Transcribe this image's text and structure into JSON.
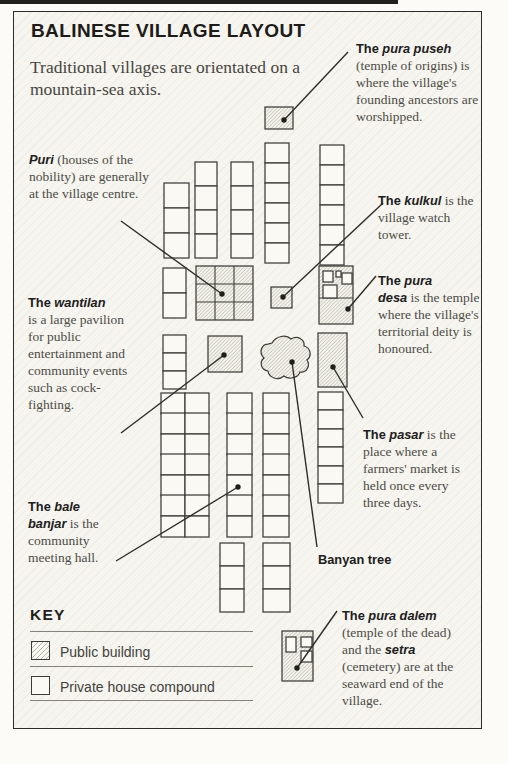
{
  "title": "BALINESE VILLAGE LAYOUT",
  "subtitle": "Traditional villages are orientated on a mountain-sea axis.",
  "colors": {
    "ink": "#2c2b27",
    "building_line": "#3d3c38",
    "hatch_line": "#b7b5ab",
    "house_fill": "#faf9f3",
    "panel_bg": "#f6f5ef",
    "leader": "#2e2d29"
  },
  "annotations": [
    {
      "id": "pura-puseh",
      "x": 356,
      "y": 40,
      "w": 124,
      "segments": [
        {
          "t": "The ",
          "s": "b"
        },
        {
          "t": "pura puseh",
          "s": "bi"
        },
        {
          "t": " (temple of origins) is where the village's founding ancestors are worshipped.",
          "s": "r"
        }
      ]
    },
    {
      "id": "puri",
      "x": 29,
      "y": 151,
      "w": 128,
      "segments": [
        {
          "t": "Puri",
          "s": "bi"
        },
        {
          "t": " (houses of the nobility) are generally at the village centre.",
          "s": "r"
        }
      ]
    },
    {
      "id": "kulkul",
      "x": 378,
      "y": 192,
      "w": 98,
      "segments": [
        {
          "t": "The ",
          "s": "b"
        },
        {
          "t": "kulkul",
          "s": "bi"
        },
        {
          "t": " is the village watch tower.",
          "s": "r"
        }
      ]
    },
    {
      "id": "pura-desa",
      "x": 378,
      "y": 272,
      "w": 105,
      "segments": [
        {
          "t": "The ",
          "s": "b"
        },
        {
          "t": "pura",
          "s": "bi"
        },
        {
          "s": "br"
        },
        {
          "t": "desa",
          "s": "bi"
        },
        {
          "t": " is the temple where the village's territorial deity is honoured.",
          "s": "r"
        }
      ]
    },
    {
      "id": "wantilan",
      "x": 28,
      "y": 294,
      "w": 106,
      "segments": [
        {
          "t": "The ",
          "s": "b"
        },
        {
          "t": "wantilan",
          "s": "bi"
        },
        {
          "s": "br"
        },
        {
          "t": "is a large pavilion for public entertainment and community events such as cock-fighting.",
          "s": "r"
        }
      ]
    },
    {
      "id": "pasar",
      "x": 363,
      "y": 426,
      "w": 115,
      "segments": [
        {
          "t": "The ",
          "s": "b"
        },
        {
          "t": "pasar",
          "s": "bi"
        },
        {
          "t": " is the place where a farmers' market is held once every three days.",
          "s": "r"
        }
      ]
    },
    {
      "id": "bale-banjar",
      "x": 28,
      "y": 498,
      "w": 100,
      "segments": [
        {
          "t": "The ",
          "s": "b"
        },
        {
          "t": "bale",
          "s": "bi"
        },
        {
          "s": "br"
        },
        {
          "t": "banjar",
          "s": "bi"
        },
        {
          "t": " is the community meeting hall.",
          "s": "r"
        }
      ]
    },
    {
      "id": "banyan-tree",
      "x": 318,
      "y": 551,
      "w": 110,
      "segments": [
        {
          "t": "Banyan tree",
          "s": "b"
        }
      ]
    },
    {
      "id": "pura-dalem",
      "x": 342,
      "y": 607,
      "w": 124,
      "segments": [
        {
          "t": "The ",
          "s": "b"
        },
        {
          "t": "pura dalem",
          "s": "bi"
        },
        {
          "t": " (temple of the dead) and the ",
          "s": "r"
        },
        {
          "t": "setra",
          "s": "bi"
        },
        {
          "t": " (cemetery) are at the seaward end of the village.",
          "s": "r"
        }
      ]
    }
  ],
  "map": {
    "houses": [
      [
        164,
        183,
        25,
        25
      ],
      [
        164,
        208,
        25,
        25
      ],
      [
        164,
        233,
        25,
        25
      ],
      [
        195,
        162,
        22,
        24
      ],
      [
        195,
        186,
        22,
        24
      ],
      [
        195,
        210,
        22,
        24
      ],
      [
        195,
        234,
        22,
        24
      ],
      [
        231,
        162,
        22,
        24
      ],
      [
        231,
        186,
        22,
        24
      ],
      [
        231,
        210,
        22,
        24
      ],
      [
        231,
        234,
        22,
        24
      ],
      [
        265,
        143,
        24,
        20
      ],
      [
        265,
        163,
        24,
        20
      ],
      [
        265,
        183,
        24,
        20
      ],
      [
        265,
        203,
        24,
        20
      ],
      [
        265,
        223,
        24,
        20
      ],
      [
        265,
        243,
        24,
        20
      ],
      [
        320,
        145,
        24,
        20
      ],
      [
        320,
        165,
        24,
        20
      ],
      [
        320,
        185,
        24,
        20
      ],
      [
        320,
        205,
        24,
        20
      ],
      [
        320,
        225,
        24,
        20
      ],
      [
        320,
        245,
        24,
        20
      ],
      [
        163,
        268,
        23,
        25
      ],
      [
        163,
        293,
        23,
        25
      ],
      [
        163,
        335,
        23,
        18
      ],
      [
        163,
        353,
        23,
        18
      ],
      [
        163,
        371,
        23,
        18
      ],
      [
        161,
        393,
        24,
        21
      ],
      [
        161,
        413,
        24,
        21
      ],
      [
        161,
        434,
        24,
        21
      ],
      [
        161,
        454,
        24,
        21
      ],
      [
        161,
        475,
        24,
        21
      ],
      [
        161,
        495,
        24,
        21
      ],
      [
        161,
        516,
        24,
        21
      ],
      [
        185,
        393,
        24,
        21
      ],
      [
        185,
        413,
        24,
        21
      ],
      [
        185,
        434,
        24,
        21
      ],
      [
        185,
        454,
        24,
        21
      ],
      [
        185,
        475,
        24,
        21
      ],
      [
        185,
        495,
        24,
        21
      ],
      [
        185,
        516,
        24,
        21
      ],
      [
        227,
        393,
        25,
        21
      ],
      [
        227,
        413,
        25,
        21
      ],
      [
        227,
        434,
        25,
        21
      ],
      [
        227,
        454,
        25,
        21
      ],
      [
        227,
        475,
        25,
        21
      ],
      [
        227,
        495,
        25,
        21
      ],
      [
        227,
        516,
        25,
        21
      ],
      [
        263,
        393,
        26,
        21
      ],
      [
        263,
        413,
        26,
        21
      ],
      [
        263,
        434,
        26,
        21
      ],
      [
        263,
        454,
        26,
        21
      ],
      [
        263,
        475,
        26,
        21
      ],
      [
        263,
        495,
        26,
        21
      ],
      [
        263,
        516,
        26,
        21
      ],
      [
        318,
        392,
        25,
        18
      ],
      [
        318,
        410,
        25,
        19
      ],
      [
        318,
        429,
        25,
        18
      ],
      [
        318,
        447,
        25,
        19
      ],
      [
        318,
        466,
        25,
        18
      ],
      [
        318,
        484,
        25,
        19
      ],
      [
        220,
        543,
        24,
        23
      ],
      [
        220,
        566,
        24,
        23
      ],
      [
        220,
        589,
        24,
        23
      ],
      [
        263,
        543,
        27,
        23
      ],
      [
        263,
        566,
        27,
        23
      ],
      [
        263,
        589,
        27,
        23
      ]
    ],
    "publics": [
      {
        "name": "pura-puseh-building",
        "r": [
          265,
          107,
          28,
          22
        ]
      },
      {
        "name": "kulkul-building",
        "r": [
          271,
          287,
          21,
          21
        ]
      },
      {
        "name": "wantilan-building",
        "r": [
          208,
          336,
          34,
          36
        ]
      },
      {
        "name": "pasar-building",
        "r": [
          318,
          333,
          29,
          54
        ]
      }
    ],
    "puri": {
      "r": [
        196,
        266,
        57,
        54
      ]
    },
    "pura_desa": {
      "r": [
        319,
        266,
        34,
        58
      ],
      "divider_y": 298,
      "inner": [
        [
          323,
          271,
          10,
          11
        ],
        [
          336,
          271,
          5,
          6
        ],
        [
          342,
          273,
          10,
          11
        ],
        [
          323,
          285,
          14,
          13
        ]
      ]
    },
    "pura_dalem": {
      "r": [
        282,
        631,
        31,
        50
      ],
      "inner": [
        [
          286,
          637,
          10,
          15
        ],
        [
          301,
          637,
          11,
          10
        ],
        [
          301,
          651,
          11,
          11
        ]
      ]
    },
    "banyan_path": "M 272 343 C 276 336 286 334 291 339 C 298 335 305 340 304 346 C 311 348 312 356 307 360 C 311 366 306 373 300 372 C 298 378 289 380 284 376 C 278 381 269 378 268 371 C 261 370 259 362 264 358 C 258 352 262 344 268 344 Z",
    "leaders": [
      {
        "name": "pura-puseh-leader",
        "line": [
          348,
          52,
          284,
          120
        ]
      },
      {
        "name": "puri-leader",
        "line": [
          121,
          221,
          222,
          294
        ]
      },
      {
        "name": "kulkul-leader",
        "line": [
          383,
          203,
          283,
          297
        ]
      },
      {
        "name": "pura-desa-leader",
        "line": [
          376,
          276,
          348,
          309
        ]
      },
      {
        "name": "wantilan-leader",
        "line": [
          121,
          433,
          224,
          355
        ]
      },
      {
        "name": "pasar-leader",
        "line": [
          363,
          418,
          333,
          367
        ]
      },
      {
        "name": "bale-banjar-leader",
        "line": [
          116,
          561,
          238,
          487
        ]
      },
      {
        "name": "banyan-leader",
        "line": [
          317,
          547,
          292,
          362
        ]
      },
      {
        "name": "pura-dalem-leader",
        "line": [
          337,
          611,
          297,
          668
        ]
      }
    ]
  },
  "key": {
    "heading": "KEY",
    "items": [
      {
        "label": "Public building",
        "swatch": "public"
      },
      {
        "label": "Private house compound",
        "swatch": "private"
      }
    ]
  }
}
